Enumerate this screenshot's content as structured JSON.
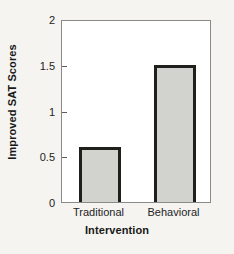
{
  "chart_data": {
    "type": "bar",
    "title": "",
    "categories": [
      "Traditional",
      "Behavioral"
    ],
    "values": [
      0.6,
      1.5
    ],
    "xlabel": "Intervention",
    "ylabel": "Improved SAT Scores",
    "ylim": [
      0,
      2
    ],
    "yticks": [
      0,
      0.5,
      1,
      1.5,
      2
    ],
    "ytick_labels": [
      "0",
      "0.5",
      "1",
      "1.5",
      "2"
    ],
    "grid": false,
    "legend": false,
    "bar_fill_color": "#d2d2cf",
    "bar_edge_color": "#1f1f1c",
    "axes_color": "#8a8a86",
    "plot_background": "#ffffff",
    "figure_background": "#f5f4f1"
  }
}
